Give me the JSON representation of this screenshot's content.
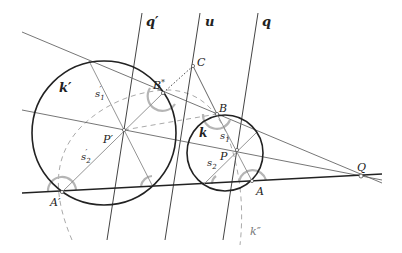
{
  "diagram": {
    "width": 402,
    "height": 253,
    "colors": {
      "circle": "#222222",
      "line": "#444444",
      "thin_line": "#888888",
      "dashed": "#aaaaaa",
      "angle_arc": "#b0b0b0"
    },
    "points": {
      "C": {
        "label": "C",
        "x": 193,
        "y": 66
      },
      "B_star": {
        "label": "B*",
        "x": 163,
        "y": 93
      },
      "B": {
        "label": "B",
        "x": 217,
        "y": 114
      },
      "P_prime": {
        "label": "P′",
        "x": 124,
        "y": 130
      },
      "P": {
        "label": "P",
        "x": 237,
        "y": 150
      },
      "A_prime": {
        "label": "A′",
        "x": 62,
        "y": 192
      },
      "A": {
        "label": "A",
        "x": 252,
        "y": 181
      },
      "Q": {
        "label": "Q",
        "x": 361,
        "y": 176
      }
    },
    "circles": {
      "k_prime": {
        "label": "k′",
        "cx": 104,
        "cy": 133,
        "r": 72
      },
      "k": {
        "label": "k",
        "cx": 225,
        "cy": 153,
        "r": 38
      },
      "k_double_prime": {
        "label": "k″"
      }
    },
    "lines": {
      "q_prime": {
        "label": "q′"
      },
      "u": {
        "label": "u"
      },
      "q": {
        "label": "q"
      }
    },
    "segments": {
      "s1_prime": {
        "label": "s′1"
      },
      "s2_prime": {
        "label": "s′2"
      },
      "s1": {
        "label": "s1"
      },
      "s2": {
        "label": "s2"
      }
    },
    "labels": {
      "k_prime": "k′",
      "k": "k",
      "k_double_prime": "k″",
      "q_prime": "q′",
      "u": "u",
      "q": "q",
      "C": "C",
      "B_star": "B",
      "B_star_sup": "*",
      "B": "B",
      "P_prime": "P′",
      "P": "P",
      "A_prime": "A′",
      "A": "A",
      "Q": "Q",
      "s1_prime_base": "s",
      "s1_prime_sub": "1",
      "s1_prime_sup": "′",
      "s2_prime_base": "s",
      "s2_prime_sub": "2",
      "s2_prime_sup": "′",
      "s1_base": "s",
      "s1_sub": "1",
      "s2_base": "s",
      "s2_sub": "2"
    }
  }
}
